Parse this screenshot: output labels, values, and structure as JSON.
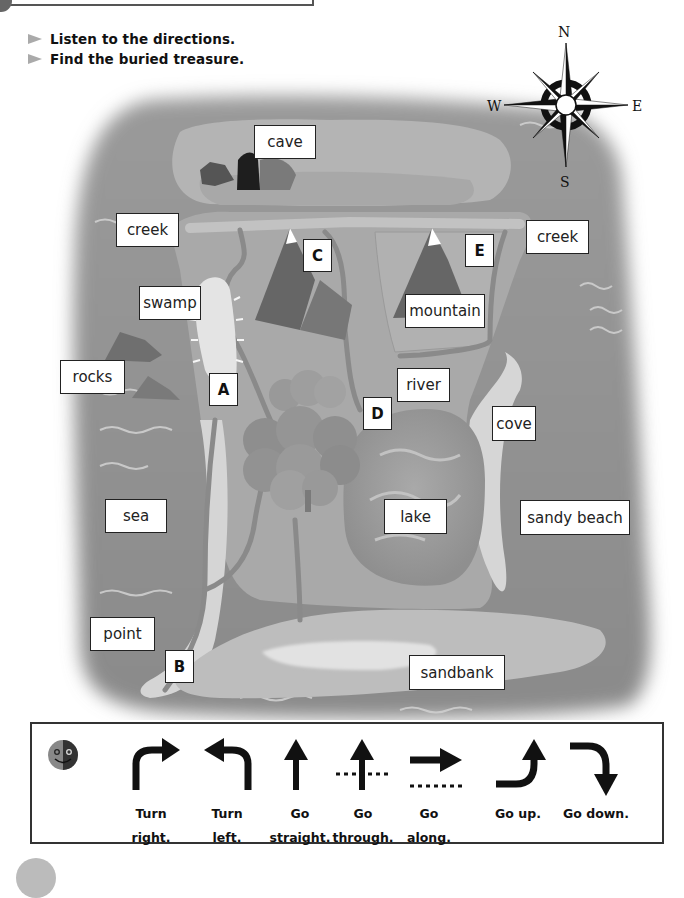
{
  "instructions": [
    "Listen to the directions.",
    "Find the buried treasure."
  ],
  "compass": {
    "north": "N",
    "south": "S",
    "east": "E",
    "west": "W"
  },
  "map_labels": {
    "cave": "cave",
    "creek_left": "creek",
    "creek_right": "creek",
    "swamp": "swamp",
    "rocks": "rocks",
    "mountain": "mountain",
    "river": "river",
    "cove": "cove",
    "sea": "sea",
    "lake": "lake",
    "sandy_beach": "sandy beach",
    "point": "point",
    "sandbank": "sandbank"
  },
  "letters": {
    "a": "A",
    "b": "B",
    "c": "C",
    "d": "D",
    "e": "E"
  },
  "legend": {
    "icon": "speaker-face-icon",
    "items": [
      {
        "icon": "turn-right-arrow-icon",
        "line1": "Turn",
        "line2": "right."
      },
      {
        "icon": "turn-left-arrow-icon",
        "line1": "Turn",
        "line2": "left."
      },
      {
        "icon": "straight-arrow-icon",
        "line1": "Go",
        "line2": "straight."
      },
      {
        "icon": "through-arrow-icon",
        "line1": "Go",
        "line2": "through."
      },
      {
        "icon": "along-arrow-icon",
        "line1": "Go",
        "line2": "along."
      },
      {
        "icon": "up-arrow-icon",
        "line1": "Go up.",
        "line2": ""
      },
      {
        "icon": "down-arrow-icon",
        "line1": "Go down.",
        "line2": ""
      }
    ]
  }
}
